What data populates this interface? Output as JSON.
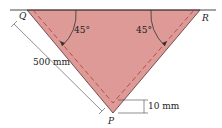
{
  "diagram": {
    "labels": {
      "Q": "Q",
      "R": "R",
      "P": "P",
      "angle_left": "45°",
      "angle_right": "45°",
      "length": "500 mm",
      "depth": "10 mm"
    },
    "colors": {
      "fill": "#d9908c",
      "line": "#333333",
      "dash": "#b03a3a"
    }
  }
}
